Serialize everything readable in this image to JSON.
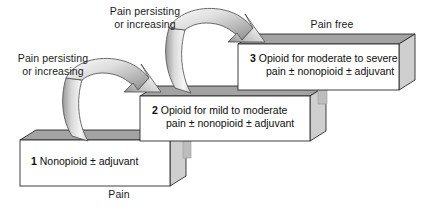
{
  "diagram": {
    "type": "three-step-ladder"
  },
  "steps": [
    {
      "number": "1",
      "line1": "Nonopioid  ±  adjuvant",
      "line2": "",
      "level": 1
    },
    {
      "number": "2",
      "line1": "Opioid for mild to moderate",
      "line2": "pain  ±  nonopioid  ±  adjuvant",
      "level": 2
    },
    {
      "number": "3",
      "line1": "Opioid for moderate to severe",
      "line2": "pain  ±  nonopioid  ±  adjuvant",
      "level": 3
    }
  ],
  "labels": {
    "bottom": "Pain",
    "top": "Pain free",
    "arrow1_line1": "Pain persisting",
    "arrow1_line2": "or increasing",
    "arrow2_line1": "Pain persisting",
    "arrow2_line2": "or increasing"
  },
  "colors": {
    "box_face": "#ffffff",
    "box_top": "#a3a3a3",
    "box_side": "#cfcfcf",
    "outline": "#2b2b2b",
    "arrow_light": "#f4f4f4",
    "arrow_mid": "#c9c9c9",
    "arrow_dark": "#8e8e8e",
    "text": "#111111",
    "background": "#ffffff"
  }
}
